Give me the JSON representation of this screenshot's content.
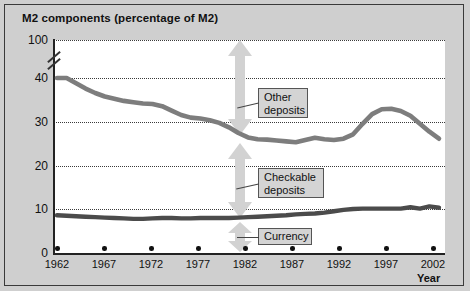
{
  "figure": {
    "title": "M2 components (percentage of M2)",
    "background_color": "#cfcfcf",
    "plot_background_color": "#ffffff",
    "series_color": "#7a7a7a",
    "currency_color": "#4a4a4a",
    "arrow_color": "#d0d0d0",
    "callout_bg": "#d4d4d4"
  },
  "chart_data": {
    "type": "line",
    "title": "M2 components (percentage of M2)",
    "xlabel": "Year",
    "ylabel": "",
    "xlim": [
      1962,
      2002
    ],
    "ylim": [
      0,
      100
    ],
    "y_break": true,
    "y_break_note": "axis broken between 40 and 100",
    "yticks": [
      0,
      10,
      20,
      30,
      40,
      100
    ],
    "ytick_labels": [
      "0",
      "10",
      "20",
      "30",
      "40",
      "100"
    ],
    "xticks": [
      1962,
      1967,
      1972,
      1977,
      1982,
      1987,
      1992,
      1997,
      2002
    ],
    "xtick_labels": [
      "1962",
      "1967",
      "1972",
      "1977",
      "1982",
      "1987",
      "1992",
      "1997",
      "2002"
    ],
    "grid": true,
    "grid_style": "dotted-horizontal",
    "legend": "inline-callouts",
    "annotations": [
      {
        "label": "Other deposits",
        "kind": "band-arrow",
        "band": "between Other-deposits line and 100%"
      },
      {
        "label": "Checkable deposits",
        "kind": "band-arrow",
        "band": "between Currency line and Other-deposits line"
      },
      {
        "label": "Currency",
        "kind": "band-arrow",
        "band": "between 0 and Currency line"
      }
    ],
    "series": [
      {
        "name": "Other deposits",
        "x": [
          1962,
          1963,
          1964,
          1965,
          1966,
          1967,
          1968,
          1969,
          1970,
          1971,
          1972,
          1973,
          1974,
          1975,
          1976,
          1977,
          1978,
          1979,
          1980,
          1981,
          1982,
          1983,
          1984,
          1985,
          1986,
          1987,
          1988,
          1989,
          1990,
          1991,
          1992,
          1993,
          1994,
          1995,
          1996,
          1997,
          1998,
          1999,
          2000,
          2001,
          2002
        ],
        "values": [
          41.0,
          40.0,
          38.8,
          37.6,
          36.6,
          35.8,
          35.3,
          34.8,
          34.5,
          34.2,
          34.1,
          33.6,
          32.6,
          31.6,
          31.0,
          30.8,
          30.4,
          29.8,
          28.8,
          27.5,
          26.5,
          26.1,
          26.0,
          25.8,
          25.6,
          25.4,
          25.9,
          26.4,
          26.1,
          25.9,
          26.2,
          27.2,
          29.6,
          31.8,
          32.9,
          33.0,
          32.5,
          31.4,
          29.6,
          27.8,
          26.2
        ]
      },
      {
        "name": "Currency",
        "x": [
          1962,
          1963,
          1964,
          1965,
          1966,
          1967,
          1968,
          1969,
          1970,
          1971,
          1972,
          1973,
          1974,
          1975,
          1976,
          1977,
          1978,
          1979,
          1980,
          1981,
          1982,
          1983,
          1984,
          1985,
          1986,
          1987,
          1988,
          1989,
          1990,
          1991,
          1992,
          1993,
          1994,
          1995,
          1996,
          1997,
          1998,
          1999,
          2000,
          2001,
          2002
        ],
        "values": [
          8.6,
          8.5,
          8.4,
          8.3,
          8.2,
          8.1,
          8.0,
          7.9,
          7.8,
          7.8,
          7.9,
          8.0,
          8.0,
          7.9,
          7.9,
          8.0,
          8.0,
          8.0,
          8.0,
          8.1,
          8.2,
          8.3,
          8.4,
          8.5,
          8.6,
          8.8,
          8.9,
          9.0,
          9.2,
          9.5,
          9.8,
          10.0,
          10.1,
          10.1,
          10.1,
          10.1,
          10.1,
          10.4,
          10.1,
          10.6,
          10.3
        ]
      }
    ],
    "series_notes": {
      "Other deposits": "declines from ~41% in 1962 to ~25% in mid-1980s, peaks ~33% around 1996-97, falls to ~26% by 2002",
      "Currency": "roughly flat near 8% through the 1970s-80s, rising to ~10% by 2002"
    }
  },
  "labels": {
    "y_axis": [
      "100",
      "40",
      "30",
      "20",
      "10",
      "0"
    ],
    "x_axis": [
      "1962",
      "1967",
      "1972",
      "1977",
      "1982",
      "1987",
      "1992",
      "1997",
      "2002"
    ],
    "x_axis_title": "Year",
    "other_deposits_line1": "Other",
    "other_deposits_line2": "deposits",
    "checkable_deposits_line1": "Checkable",
    "checkable_deposits_line2": "deposits",
    "currency": "Currency"
  }
}
